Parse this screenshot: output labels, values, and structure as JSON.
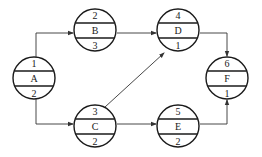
{
  "diagram": {
    "type": "activity-network",
    "nodes": [
      {
        "id": "A",
        "top": "1",
        "name": "A",
        "bottom": "2",
        "cx": 34,
        "cy": 78
      },
      {
        "id": "B",
        "top": "2",
        "name": "B",
        "bottom": "3",
        "cx": 95,
        "cy": 30
      },
      {
        "id": "C",
        "top": "3",
        "name": "C",
        "bottom": "2",
        "cx": 95,
        "cy": 126
      },
      {
        "id": "D",
        "top": "4",
        "name": "D",
        "bottom": "1",
        "cx": 178,
        "cy": 30
      },
      {
        "id": "E",
        "top": "5",
        "name": "E",
        "bottom": "2",
        "cx": 178,
        "cy": 126
      },
      {
        "id": "F",
        "top": "6",
        "name": "F",
        "bottom": "1",
        "cx": 227,
        "cy": 78
      }
    ],
    "edges": [
      {
        "from": "A",
        "to": "B"
      },
      {
        "from": "A",
        "to": "C"
      },
      {
        "from": "B",
        "to": "D"
      },
      {
        "from": "C",
        "to": "D"
      },
      {
        "from": "C",
        "to": "E"
      },
      {
        "from": "D",
        "to": "F"
      },
      {
        "from": "E",
        "to": "F"
      }
    ],
    "colors": {
      "stroke": "#1a1a1a",
      "background": "#ffffff"
    }
  }
}
